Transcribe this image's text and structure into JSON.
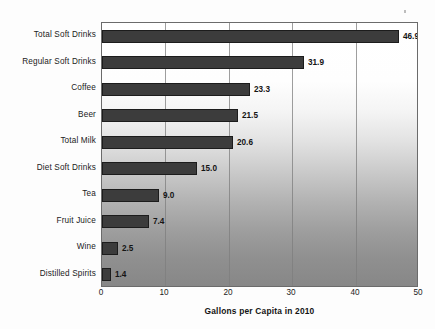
{
  "chart_data": {
    "type": "bar",
    "orientation": "horizontal",
    "title": "",
    "xlabel": "Gallons per Capita in 2010",
    "ylabel": "",
    "categories": [
      "Total Soft Drinks",
      "Regular Soft Drinks",
      "Coffee",
      "Beer",
      "Total Milk",
      "Diet Soft Drinks",
      "Tea",
      "Fruit Juice",
      "Wine",
      "Distilled Spirits"
    ],
    "values": [
      46.9,
      31.9,
      23.3,
      21.5,
      20.6,
      15.0,
      9.0,
      7.4,
      2.5,
      1.4
    ],
    "value_labels": [
      "46.9",
      "31.9",
      "23.3",
      "21.5",
      "20.6",
      "15.0",
      "9.0",
      "7.4",
      "2.5",
      "1.4"
    ],
    "xlim": [
      0,
      50
    ],
    "xticks": [
      0,
      10,
      20,
      30,
      40,
      50
    ],
    "xtick_labels": [
      "0",
      "10",
      "20",
      "30",
      "40",
      "50"
    ],
    "gridlines": [
      10,
      20,
      30,
      40
    ],
    "grid": true,
    "legend": false,
    "bar_color": "#3c3c3c",
    "bar_edge_color": "#1c1c1c",
    "plot_bg_top_color": "#ffffff",
    "plot_bg_bottom_color": "#878787",
    "page_bg_color": "#ffffff",
    "text_color": "#1b1b1b"
  }
}
